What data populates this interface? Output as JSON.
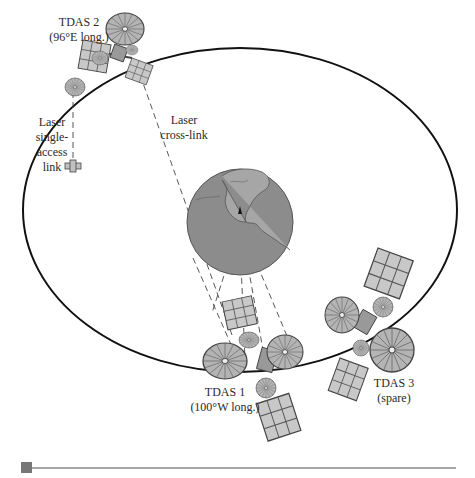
{
  "diagram": {
    "type": "satellite-orbit-illustration",
    "colors": {
      "background": "#ffffff",
      "orbit": "#111111",
      "globe": "#8c8c8c",
      "globe_outline": "#555555",
      "land_outline": "#555555",
      "panel": "#c8c8c8",
      "dish": "#b4b4b4",
      "link": "#444444",
      "rule": "#8a8a8a",
      "rule_marker": "#777777"
    },
    "satellites": [
      {
        "id": "tdas2",
        "name": "TDAS 2",
        "position": "(96°E long.)"
      },
      {
        "id": "tdas1",
        "name": "TDAS 1",
        "position": "(100°W long.)"
      },
      {
        "id": "tdas3",
        "name": "TDAS 3",
        "position": "(spare)"
      }
    ],
    "links": {
      "single_access": {
        "line1": "Laser",
        "line2": "single-",
        "line3": "access",
        "line4": "link"
      },
      "cross_link": {
        "line1": "Laser",
        "line2": "cross-link"
      }
    }
  }
}
